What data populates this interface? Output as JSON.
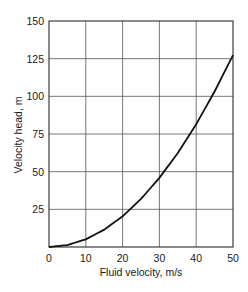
{
  "chart_data": {
    "type": "line",
    "title": "",
    "xlabel": "Fluid velocity, m/s",
    "ylabel": "Velocity head, m",
    "xlim": [
      0,
      50
    ],
    "ylim": [
      0,
      150
    ],
    "x_ticks": [
      0,
      10,
      20,
      30,
      40,
      50
    ],
    "y_ticks": [
      25,
      50,
      75,
      100,
      125,
      150
    ],
    "y_tick_labels": [
      "25",
      "50",
      "75",
      "100",
      "125",
      "150"
    ],
    "x_tick_labels": [
      "0",
      "10",
      "20",
      "30",
      "40",
      "50"
    ],
    "grid": true,
    "legend": null,
    "series": [
      {
        "name": "Velocity head",
        "x": [
          0,
          5,
          10,
          15,
          20,
          25,
          30,
          35,
          40,
          45,
          50
        ],
        "y": [
          0,
          1.3,
          5.1,
          11.5,
          20.4,
          31.9,
          45.9,
          62.4,
          81.5,
          103.2,
          127.4
        ]
      }
    ]
  },
  "labels": {
    "xlabel": "Fluid velocity, m/s",
    "ylabel": "Velocity head, m"
  }
}
